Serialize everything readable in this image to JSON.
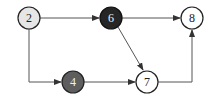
{
  "diagram": {
    "type": "directed-graph",
    "nodes": [
      {
        "id": "2",
        "label": "2",
        "x": 29,
        "y": 18,
        "fill": "#e6e6e6",
        "text_color": "#222222"
      },
      {
        "id": "6",
        "label": "6",
        "x": 111,
        "y": 18,
        "fill": "#262626",
        "text_color": "#f0f0f0"
      },
      {
        "id": "8",
        "label": "8",
        "x": 192,
        "y": 18,
        "fill": "#ffffff",
        "text_color": "#222222"
      },
      {
        "id": "4",
        "label": "4",
        "x": 73,
        "y": 82,
        "fill": "#5e5e5e",
        "text_color": "#f0f0f0"
      },
      {
        "id": "7",
        "label": "7",
        "x": 147,
        "y": 82,
        "fill": "#ffffff",
        "text_color": "#222222"
      }
    ],
    "edges": [
      {
        "from": "2",
        "to": "6"
      },
      {
        "from": "6",
        "to": "8"
      },
      {
        "from": "6",
        "to": "7"
      },
      {
        "from": "2",
        "to": "4"
      },
      {
        "from": "4",
        "to": "7"
      },
      {
        "from": "7",
        "to": "8"
      }
    ]
  }
}
